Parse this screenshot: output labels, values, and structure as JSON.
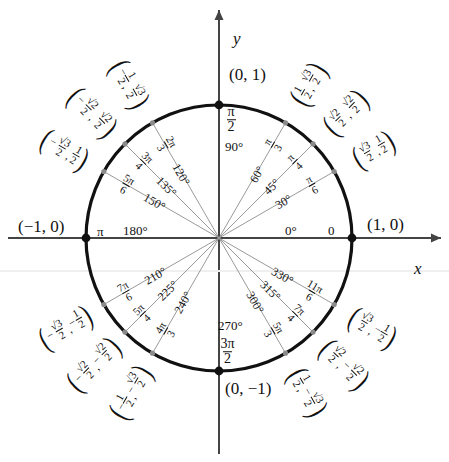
{
  "geometry": {
    "cx": 219,
    "cy": 238,
    "r": 133,
    "axis_color": "#444444",
    "circle_color": "#111111",
    "spoke_color": "#9a9a9a",
    "dot_color": "#111111",
    "minor_dot_color": "#8a8a8a"
  },
  "axes": {
    "x_label": "x",
    "y_label": "y"
  },
  "cardinal_points": [
    {
      "name": "point-0-1",
      "label": "(0, 1)"
    },
    {
      "name": "point-1-0",
      "label": "(1, 0)"
    },
    {
      "name": "point-neg1-0",
      "label": "(−1, 0)"
    },
    {
      "name": "point-0-neg1",
      "label": "(0, −1)"
    }
  ],
  "axis_angle_labels": {
    "zero_degree": "0°",
    "zero_radian": "0",
    "ninety_degree": "90°",
    "ninety_radian_num": "π",
    "ninety_radian_den": "2",
    "one_eighty_degree": "180°",
    "one_eighty_radian": "π",
    "two_seventy_degree": "270°",
    "two_seventy_radian_num": "3π",
    "two_seventy_radian_den": "2"
  },
  "spokes": [
    {
      "deg": 30,
      "degree_label": "30°",
      "rad_num": "π",
      "rad_den": "6"
    },
    {
      "deg": 45,
      "degree_label": "45°",
      "rad_num": "π",
      "rad_den": "4"
    },
    {
      "deg": 60,
      "degree_label": "60°",
      "rad_num": "π",
      "rad_den": "3"
    },
    {
      "deg": 120,
      "degree_label": "120°",
      "rad_num": "2π",
      "rad_den": "3"
    },
    {
      "deg": 135,
      "degree_label": "135°",
      "rad_num": "3π",
      "rad_den": "4"
    },
    {
      "deg": 150,
      "degree_label": "150°",
      "rad_num": "5π",
      "rad_den": "6"
    },
    {
      "deg": 210,
      "degree_label": "210°",
      "rad_num": "7π",
      "rad_den": "6"
    },
    {
      "deg": 225,
      "degree_label": "225°",
      "rad_num": "5π",
      "rad_den": "4"
    },
    {
      "deg": 240,
      "degree_label": "240°",
      "rad_num": "4π",
      "rad_den": "3"
    },
    {
      "deg": 300,
      "degree_label": "300°",
      "rad_num": "5π",
      "rad_den": "3"
    },
    {
      "deg": 315,
      "degree_label": "315°",
      "rad_num": "7π",
      "rad_den": "4"
    },
    {
      "deg": 330,
      "degree_label": "330°",
      "rad_num": "11π",
      "rad_den": "6"
    }
  ],
  "coordinate_labels": [
    {
      "deg": 30,
      "x_sign": "",
      "x_num": "√3",
      "x_den": "2",
      "y_sign": "",
      "y_num": "1",
      "y_den": "2"
    },
    {
      "deg": 45,
      "x_sign": "",
      "x_num": "√2",
      "x_den": "2",
      "y_sign": "",
      "y_num": "√2",
      "y_den": "2"
    },
    {
      "deg": 60,
      "x_sign": "",
      "x_num": "1",
      "x_den": "2",
      "y_sign": "",
      "y_num": "√3",
      "y_den": "2"
    },
    {
      "deg": 120,
      "x_sign": "−",
      "x_num": "1",
      "x_den": "2",
      "y_sign": "",
      "y_num": "√3",
      "y_den": "2"
    },
    {
      "deg": 135,
      "x_sign": "−",
      "x_num": "√2",
      "x_den": "2",
      "y_sign": "",
      "y_num": "√2",
      "y_den": "2"
    },
    {
      "deg": 150,
      "x_sign": "−",
      "x_num": "√3",
      "x_den": "2",
      "y_sign": "",
      "y_num": "1",
      "y_den": "2"
    },
    {
      "deg": 210,
      "x_sign": "−",
      "x_num": "√3",
      "x_den": "2",
      "y_sign": "−",
      "y_num": "1",
      "y_den": "2"
    },
    {
      "deg": 225,
      "x_sign": "−",
      "x_num": "√2",
      "x_den": "2",
      "y_sign": "−",
      "y_num": "√2",
      "y_den": "2"
    },
    {
      "deg": 240,
      "x_sign": "−",
      "x_num": "1",
      "x_den": "2",
      "y_sign": "−",
      "y_num": "√3",
      "y_den": "2"
    },
    {
      "deg": 300,
      "x_sign": "",
      "x_num": "1",
      "x_den": "2",
      "y_sign": "−",
      "y_num": "√3",
      "y_den": "2"
    },
    {
      "deg": 315,
      "x_sign": "",
      "x_num": "√2",
      "x_den": "2",
      "y_sign": "−",
      "y_num": "√2",
      "y_den": "2"
    },
    {
      "deg": 330,
      "x_sign": "",
      "x_num": "√3",
      "x_den": "2",
      "y_sign": "−",
      "y_num": "1",
      "y_den": "2"
    }
  ]
}
